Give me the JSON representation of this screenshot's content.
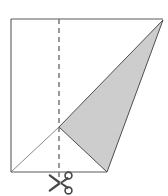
{
  "figure": {
    "background_color": "#ffffff",
    "width": 168,
    "height": 196,
    "square": {
      "label": "paper-square",
      "stroke_color": "#5a5a5a",
      "stroke_width": 1.1,
      "fill": "none",
      "corners": {
        "top_left": [
          11,
          19
        ],
        "top_right": [
          163,
          19
        ],
        "bottom_right": [
          163,
          172
        ],
        "bottom_left": [
          11,
          172
        ]
      },
      "drawn_edges": [
        {
          "name": "top-edge",
          "from": [
            11,
            19
          ],
          "to": [
            163,
            19
          ]
        },
        {
          "name": "left-edge",
          "from": [
            11,
            19
          ],
          "to": [
            11,
            172
          ]
        },
        {
          "name": "bottom-edge-partial",
          "from": [
            11,
            172
          ],
          "to": [
            107,
            172
          ]
        }
      ],
      "right_edge_drawn": false
    },
    "fold_line": {
      "label": "fold-crease-dashed",
      "orientation": "vertical",
      "x": 59,
      "y_start": 19,
      "y_end": 180,
      "stroke_color": "#6e6e6e",
      "stroke_width": 1.4,
      "dash_length": 5,
      "gap_length": 4
    },
    "shaded_triangle": {
      "label": "shaded-triangle",
      "fill_color": "#cfcfcf",
      "stroke_color": "#4a4a4a",
      "stroke_width": 1.0,
      "vertices": [
        {
          "name": "left-vertex-on-fold",
          "x": 59,
          "y": 127
        },
        {
          "name": "apex-top-right",
          "x": 163,
          "y": 20
        },
        {
          "name": "base-vertex-bottom",
          "x": 107,
          "y": 172
        }
      ]
    },
    "crease_diagonal": {
      "label": "thin-diagonal-crease",
      "from": [
        11,
        172
      ],
      "to": [
        59,
        127
      ],
      "stroke_color": "#7a7a7a",
      "stroke_width": 0.9
    },
    "scissors": {
      "label": "scissors-cut-marker",
      "glyph": "✂",
      "center_x": 61,
      "center_y": 183,
      "size": 13,
      "color": "#4a4a4a",
      "rotation_deg": -90
    }
  },
  "accessibility": {
    "description": "A square sheet of paper with a vertical dashed fold line down the middle, a shaded triangle occupying the right portion, a thin diagonal crease in the lower left, and a scissors symbol below the fold line indicating where to cut."
  }
}
